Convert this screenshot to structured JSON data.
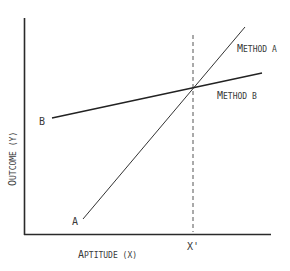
{
  "diagram": {
    "type": "line",
    "xlabel": "Aptitude (X)",
    "ylabel": "Outcome (Y)",
    "x_marker": "X'",
    "series": [
      {
        "name": "Method A",
        "start_label": "A",
        "end_label": "Method A",
        "x1": 83,
        "y1": 219,
        "x2": 245,
        "y2": 27
      },
      {
        "name": "Method B",
        "start_label": "B",
        "end_label": "Method B",
        "x1": 52,
        "y1": 118,
        "x2": 262,
        "y2": 73
      }
    ],
    "intersection": {
      "label": "X'",
      "x": 193,
      "y": 87
    },
    "colors": {
      "axis": "#2a2a2a",
      "line": "#333333",
      "text": "#3a3a3a"
    }
  },
  "labels": {
    "method_a": "Method A",
    "method_b": "Method B",
    "a_start": "A",
    "b_start": "B",
    "x_prime": "X'",
    "x_axis_prefix": "A",
    "x_axis_rest": "PTITUDE (X)",
    "y_axis_prefix": "O",
    "y_axis_rest": "UTCOME (Y)",
    "method_a_prefix": "M",
    "method_a_rest": "ETHOD A",
    "method_b_prefix": "M",
    "method_b_rest": "ETHOD B"
  }
}
